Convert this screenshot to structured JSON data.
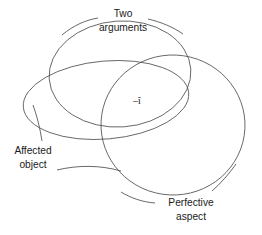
{
  "figure": {
    "background_color": "#ffffff",
    "stroke_color": "#4d4d4d",
    "text_color": "#1a1a1a"
  },
  "labels": {
    "top": {
      "line1": "Two",
      "line2": "arguments"
    },
    "left": {
      "line1": "Affected",
      "line2": "object"
    },
    "bottom_right": {
      "line1": "Perfective",
      "line2": "aspect"
    },
    "center": {
      "text": "–ĭ"
    }
  },
  "sets": [
    {
      "name": "two-arguments",
      "shape": "circle"
    },
    {
      "name": "affected-object",
      "shape": "ellipse"
    },
    {
      "name": "perfective-aspect",
      "shape": "circle"
    }
  ]
}
